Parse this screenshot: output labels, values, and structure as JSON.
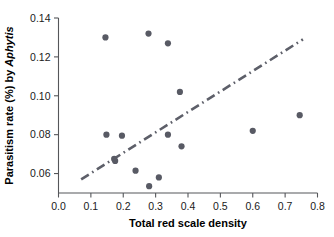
{
  "chart_data": {
    "type": "scatter",
    "title": "",
    "subtitle": "",
    "xlabel": "Total red scale density",
    "ylabel_parts": {
      "prefix": "Parasitism rate (%) by ",
      "italic": "Aphytis"
    },
    "ylabel": "Parasitism rate (%) by Aphytis",
    "xlim": [
      0.0,
      0.8
    ],
    "ylim": [
      0.05,
      0.14
    ],
    "xticks": [
      0.0,
      0.1,
      0.2,
      0.3,
      0.4,
      0.5,
      0.6,
      0.7,
      0.8
    ],
    "xtick_labels": [
      "0.0",
      "0.1",
      "0.2",
      "0.3",
      "0.4",
      "0.5",
      "0.6",
      "0.7",
      "0.8"
    ],
    "yticks": [
      0.06,
      0.08,
      0.1,
      0.12,
      0.14
    ],
    "ytick_labels": [
      "0.06",
      "0.08",
      "0.10",
      "0.12",
      "0.14"
    ],
    "grid": false,
    "legend": false,
    "marker_color": "#585a64",
    "line_color": "#5d5f69",
    "axis_color": "#55565a",
    "points": [
      {
        "x": 0.145,
        "y": 0.13
      },
      {
        "x": 0.278,
        "y": 0.132
      },
      {
        "x": 0.338,
        "y": 0.127
      },
      {
        "x": 0.375,
        "y": 0.102
      },
      {
        "x": 0.148,
        "y": 0.08
      },
      {
        "x": 0.196,
        "y": 0.0795
      },
      {
        "x": 0.338,
        "y": 0.08
      },
      {
        "x": 0.6,
        "y": 0.082
      },
      {
        "x": 0.745,
        "y": 0.09
      },
      {
        "x": 0.38,
        "y": 0.074
      },
      {
        "x": 0.175,
        "y": 0.0665
      },
      {
        "x": 0.172,
        "y": 0.0675
      },
      {
        "x": 0.238,
        "y": 0.0615
      },
      {
        "x": 0.28,
        "y": 0.0535
      },
      {
        "x": 0.31,
        "y": 0.058
      }
    ],
    "fit_line": {
      "style": "dash-dot",
      "x_start": 0.07,
      "y_start": 0.057,
      "x_end": 0.755,
      "y_end": 0.129
    }
  }
}
